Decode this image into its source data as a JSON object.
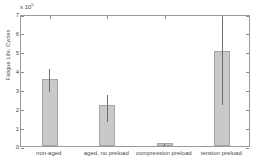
{
  "chart_data": {
    "type": "bar",
    "title": "",
    "xlabel": "",
    "ylabel": "Fatigue Life, Cycles",
    "y_multiplier": "x 10",
    "y_exponent": "5",
    "categories": [
      "non-aged",
      "aged, no preload",
      "compression preload",
      "tension preload"
    ],
    "values": [
      3.55,
      2.15,
      0.15,
      5.05
    ],
    "error_low": [
      2.95,
      1.4,
      0.1,
      2.3
    ],
    "error_high": [
      4.2,
      2.8,
      0.2,
      6.95
    ],
    "yticks": [
      "0",
      "1",
      "2",
      "3",
      "4",
      "5",
      "6",
      "7"
    ],
    "ylim": [
      0,
      7
    ],
    "grid": false,
    "legend": "none",
    "units_note": "Values in units of 10^5 cycles"
  }
}
